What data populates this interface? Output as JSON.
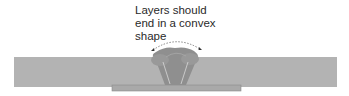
{
  "annotation": {
    "lines": [
      "Layers should",
      "end in a convex",
      "shape"
    ]
  },
  "colors": {
    "plate": "#b0b0b0",
    "weld": "#8c8c8c",
    "backing": "#a8a8a8",
    "text": "#2a2a2a"
  }
}
